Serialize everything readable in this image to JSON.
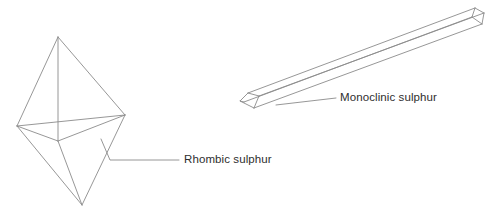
{
  "figure": {
    "background_color": "#ffffff",
    "line_color": "#8b8b8b",
    "text_color": "#2e2e2e",
    "width": 493,
    "height": 218
  },
  "labels": {
    "rhombic": "Rhombic sulphur",
    "monoclinic": "Monoclinic sulphur"
  },
  "shapes": {
    "rhombic_crystal": {
      "name": "rhombic-sulphur-crystal",
      "description": "octahedral bipyramid",
      "vertices": {
        "top_apex": [
          58,
          37
        ],
        "left": [
          17,
          126
        ],
        "center": [
          58,
          141
        ],
        "right": [
          125,
          115
        ],
        "bottom_apex": [
          82,
          205
        ]
      }
    },
    "monoclinic_crystal": {
      "name": "monoclinic-sulphur-crystal",
      "description": "elongated needle prism",
      "vertices": {
        "bottom_tip": [
          240,
          108
        ],
        "top_tip": [
          484,
          16
        ]
      }
    }
  },
  "leaders": {
    "rhombic": {
      "from": [
        101,
        139
      ],
      "to": [
        179,
        160
      ]
    },
    "monoclinic": {
      "from": [
        276,
        105
      ],
      "to": [
        336,
        98
      ]
    }
  }
}
